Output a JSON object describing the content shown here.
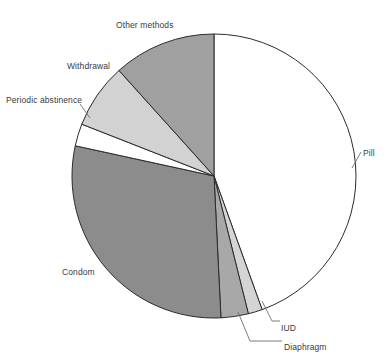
{
  "chart_data": {
    "type": "pie",
    "title": "",
    "subtitle": "",
    "xlabel": "",
    "ylabel": "",
    "legend_position": "none",
    "grid": false,
    "label_placement": "outside-with-leader-lines",
    "start_angle_deg": 0,
    "direction": "clockwise",
    "categories": [
      "Pill",
      "IUD",
      "Diaphragm",
      "Condom",
      "Periodic abstinence",
      "Withdrawal",
      "Other methods"
    ],
    "values": [
      44.5,
      1.6,
      3.1,
      29.2,
      2.5,
      7.4,
      11.7
    ],
    "slices": [
      {
        "label": "Pill",
        "value": 44.5,
        "start_deg": 0,
        "end_deg": 160.2,
        "color": "#ffffff"
      },
      {
        "label": "IUD",
        "value": 1.6,
        "start_deg": 160.2,
        "end_deg": 166.0,
        "color": "#d4d4d4"
      },
      {
        "label": "Diaphragm",
        "value": 3.1,
        "start_deg": 166.0,
        "end_deg": 177.2,
        "color": "#a8a8a8"
      },
      {
        "label": "Condom",
        "value": 29.2,
        "start_deg": 177.2,
        "end_deg": 282.3,
        "color": "#8c8c8c"
      },
      {
        "label": "Periodic abstinence",
        "value": 2.5,
        "start_deg": 282.3,
        "end_deg": 291.4,
        "color": "#ffffff"
      },
      {
        "label": "Withdrawal",
        "value": 7.4,
        "start_deg": 291.4,
        "end_deg": 318.0,
        "color": "#d2d2d2"
      },
      {
        "label": "Other methods",
        "value": 11.7,
        "start_deg": 318.0,
        "end_deg": 360,
        "color": "#a0a0a0"
      }
    ]
  },
  "labels": {
    "pill": "Pill",
    "iud": "IUD",
    "diaphragm": "Diaphragm",
    "condom": "Condom",
    "periodic_abstinence": "Periodic abstinence",
    "withdrawal": "Withdrawal",
    "other_methods": "Other methods"
  },
  "colors": {
    "outline": "#2b2b2b",
    "leader_line": "#6d6d6d",
    "label_text": "#3a3a3a",
    "background": "#ffffff",
    "slice_white": "#ffffff",
    "slice_light_gray": "#d2d2d2",
    "slice_mid_gray": "#a8a8a8",
    "slice_dark_gray": "#8c8c8c"
  }
}
